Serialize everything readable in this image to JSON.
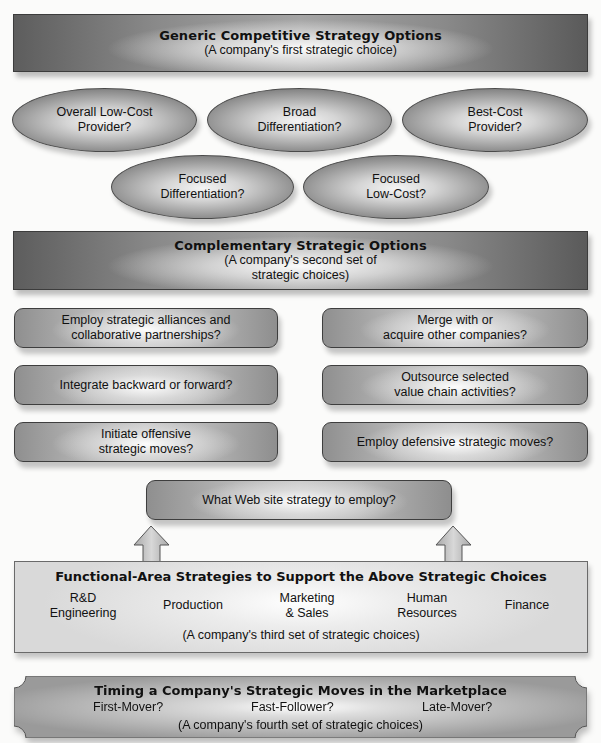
{
  "generic": {
    "title": "Generic Competitive Strategy Options",
    "subtitle": "(A company's first strategic choice)",
    "options": [
      {
        "line1": "Overall Low-Cost",
        "line2": "Provider?"
      },
      {
        "line1": "Broad",
        "line2": "Differentiation?"
      },
      {
        "line1": "Best-Cost",
        "line2": "Provider?"
      },
      {
        "line1": "Focused",
        "line2": "Differentiation?"
      },
      {
        "line1": "Focused",
        "line2": "Low-Cost?"
      }
    ]
  },
  "complementary": {
    "title": "Complementary Strategic Options",
    "subtitle_line1": "(A company's second set of",
    "subtitle_line2": "strategic choices)",
    "options": [
      {
        "line1": "Employ strategic alliances and",
        "line2": "collaborative partnerships?"
      },
      {
        "line1": "Merge with or",
        "line2": "acquire other companies?"
      },
      {
        "line1": "Integrate backward or forward?",
        "line2": ""
      },
      {
        "line1": "Outsource selected",
        "line2": "value chain activities?"
      },
      {
        "line1": "Initiate offensive",
        "line2": "strategic moves?"
      },
      {
        "line1": "Employ defensive strategic moves?",
        "line2": ""
      }
    ]
  },
  "website": {
    "label": "What Web site strategy to employ?"
  },
  "functional": {
    "title": "Functional-Area Strategies to Support the Above Strategic Choices",
    "areas": [
      {
        "line1": "R&D",
        "line2": "Engineering"
      },
      {
        "line1": "Production",
        "line2": ""
      },
      {
        "line1": "Marketing",
        "line2": "& Sales"
      },
      {
        "line1": "Human",
        "line2": "Resources"
      },
      {
        "line1": "Finance",
        "line2": ""
      }
    ],
    "subtitle": "(A company's third set of strategic choices)"
  },
  "timing": {
    "title": "Timing a Company's Strategic Moves in the Marketplace",
    "options": [
      "First-Mover?",
      "Fast-Follower?",
      "Late-Mover?"
    ],
    "subtitle": "(A company's fourth set of strategic choices)"
  }
}
